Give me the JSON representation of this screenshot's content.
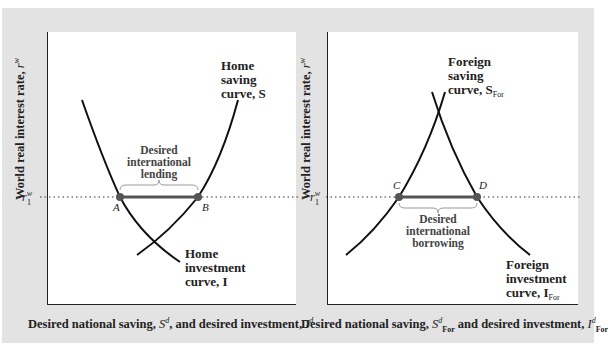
{
  "left_panel": {
    "y_axis_label": "World real interest rate, ",
    "y_axis_var": "r",
    "y_axis_sup": "w",
    "x_axis_label_pre": "Desired national saving, ",
    "x_axis_var1": "S",
    "x_axis_sup1": "d",
    "x_axis_label_mid": ", and desired investment, ",
    "x_axis_var2": "I",
    "x_axis_sup2": "d",
    "rate_label": "r",
    "rate_sup": "w",
    "rate_sub": "1",
    "saving_curve_label": [
      "Home",
      "saving",
      "curve, S"
    ],
    "investment_curve_label": [
      "Home",
      "investment",
      "curve, I"
    ],
    "gap_label": [
      "Desired",
      "international",
      "lending"
    ],
    "point_a": "A",
    "point_b": "B"
  },
  "right_panel": {
    "y_axis_label": "World real interest rate, ",
    "y_axis_var": "r",
    "y_axis_sup": "w",
    "x_axis_label_pre": "Desired national saving, ",
    "x_axis_var1": "S",
    "x_axis_sup1": "d",
    "x_axis_sub1": "For",
    "x_axis_label_mid": " and desired investment, ",
    "x_axis_var2": "I",
    "x_axis_sup2": "d",
    "x_axis_sub2": "For",
    "rate_label": "r",
    "rate_sup": "w",
    "rate_sub": "1",
    "saving_curve_label": [
      "Foreign",
      "saving",
      "curve, S"
    ],
    "saving_curve_sub": "For",
    "investment_curve_label": [
      "Foreign",
      "investment",
      "curve, I"
    ],
    "investment_curve_sub": "For",
    "gap_label": [
      "Desired",
      "international",
      "borrowing"
    ],
    "point_c": "C",
    "point_d": "D"
  },
  "colors": {
    "background": "#e3e3e3",
    "panel": "#ffffff",
    "curve": "#111111",
    "segment": "#555555",
    "point": "#555555",
    "brace": "#999999"
  }
}
